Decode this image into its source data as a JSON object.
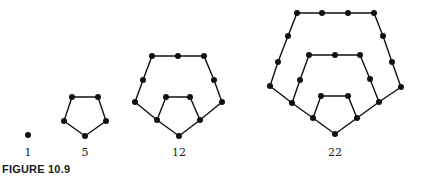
{
  "figure": {
    "caption": "FIGURE 10.9",
    "labels": [
      "1",
      "5",
      "12",
      "22"
    ],
    "colors": {
      "ink": "#111111",
      "background": "#ffffff"
    }
  },
  "graphs": [
    {
      "label": "1",
      "vertices": [
        [
          28,
          135
        ]
      ],
      "paths": []
    },
    {
      "label": "5",
      "vertices": [
        [
          72,
          97
        ],
        [
          98,
          97
        ],
        [
          106,
          121
        ],
        [
          85,
          136
        ],
        [
          64,
          121
        ]
      ],
      "paths": [
        [
          [
            72,
            97
          ],
          [
            98,
            97
          ],
          [
            106,
            121
          ],
          [
            85,
            136
          ],
          [
            64,
            121
          ],
          [
            72,
            97
          ]
        ]
      ]
    },
    {
      "label": "12",
      "vertices": [
        [
          152,
          56
        ],
        [
          178,
          56
        ],
        [
          204,
          56
        ],
        [
          143,
          80
        ],
        [
          214,
          80
        ],
        [
          135,
          102
        ],
        [
          222,
          102
        ],
        [
          166,
          97
        ],
        [
          190,
          97
        ],
        [
          157,
          120
        ],
        [
          200,
          120
        ],
        [
          179,
          136
        ]
      ],
      "paths": [
        [
          [
            157,
            120
          ],
          [
            135,
            102
          ],
          [
            143,
            80
          ],
          [
            152,
            56
          ],
          [
            178,
            56
          ],
          [
            204,
            56
          ],
          [
            214,
            80
          ],
          [
            222,
            102
          ],
          [
            200,
            120
          ]
        ],
        [
          [
            166,
            97
          ],
          [
            190,
            97
          ],
          [
            200,
            120
          ],
          [
            179,
            136
          ],
          [
            157,
            120
          ],
          [
            166,
            97
          ]
        ]
      ]
    },
    {
      "label": "22",
      "vertices": [
        [
          297,
          13
        ],
        [
          322,
          13
        ],
        [
          348,
          13
        ],
        [
          374,
          13
        ],
        [
          288,
          36
        ],
        [
          278,
          62
        ],
        [
          270,
          86
        ],
        [
          383,
          36
        ],
        [
          392,
          62
        ],
        [
          401,
          87
        ],
        [
          309,
          55
        ],
        [
          335,
          55
        ],
        [
          360,
          55
        ],
        [
          300,
          80
        ],
        [
          370,
          79
        ],
        [
          292,
          103
        ],
        [
          379,
          102
        ],
        [
          321,
          96
        ],
        [
          348,
          96
        ],
        [
          313,
          118
        ],
        [
          357,
          118
        ],
        [
          335,
          134
        ]
      ],
      "paths": [
        [
          [
            292,
            103
          ],
          [
            270,
            86
          ],
          [
            278,
            62
          ],
          [
            288,
            36
          ],
          [
            297,
            13
          ],
          [
            322,
            13
          ],
          [
            348,
            13
          ],
          [
            374,
            13
          ],
          [
            383,
            36
          ],
          [
            392,
            62
          ],
          [
            401,
            87
          ],
          [
            379,
            102
          ]
        ],
        [
          [
            313,
            118
          ],
          [
            292,
            103
          ],
          [
            300,
            80
          ],
          [
            309,
            55
          ],
          [
            335,
            55
          ],
          [
            360,
            55
          ],
          [
            370,
            79
          ],
          [
            379,
            102
          ],
          [
            357,
            118
          ]
        ],
        [
          [
            321,
            96
          ],
          [
            348,
            96
          ],
          [
            357,
            118
          ],
          [
            335,
            134
          ],
          [
            313,
            118
          ],
          [
            321,
            96
          ]
        ]
      ]
    }
  ]
}
